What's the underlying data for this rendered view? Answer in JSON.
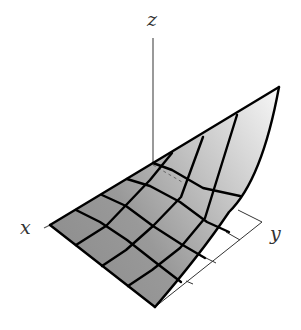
{
  "figure": {
    "axes": {
      "x": {
        "label": "x"
      },
      "y": {
        "label": "y"
      },
      "z": {
        "label": "z"
      }
    },
    "grid": {
      "rows": 4,
      "cols": 4
    },
    "colors": {
      "surface_dark": "#8a8a8a",
      "surface_light": "#f2f2f2",
      "mesh_line": "#000000",
      "axis_line": "#555555",
      "floor_line": "#333333"
    }
  }
}
